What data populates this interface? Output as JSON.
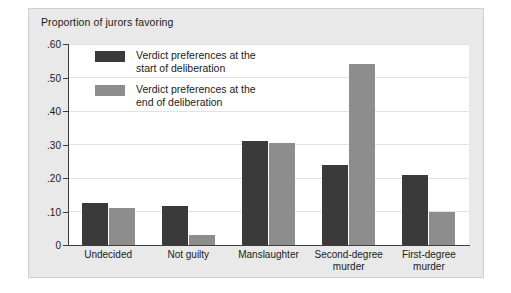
{
  "figure": {
    "title": "Proportion of jurors favoring"
  },
  "legend": {
    "items": [
      {
        "key": "start",
        "label": "Verdict preferences at the\nstart of deliberation",
        "color": "#3a3a3a"
      },
      {
        "key": "end",
        "label": "Verdict preferences at the\nend of deliberation",
        "color": "#8d8d8d"
      }
    ]
  },
  "axis": {
    "y_ticks": [
      "0",
      ".10",
      ".20",
      ".30",
      ".40",
      ".50",
      ".60"
    ]
  },
  "chart_data": {
    "type": "bar",
    "title": "Proportion of jurors favoring",
    "xlabel": "",
    "ylabel": "",
    "ylim": [
      0,
      0.6
    ],
    "ytick_values": [
      0,
      0.1,
      0.2,
      0.3,
      0.4,
      0.5,
      0.6
    ],
    "ytick_labels": [
      "0",
      ".10",
      ".20",
      ".30",
      ".40",
      ".50",
      ".60"
    ],
    "grid": true,
    "legend_position": "upper-left-inside",
    "categories": [
      "Undecided",
      "Not guilty",
      "Manslaughter",
      "Second-degree murder",
      "First-degree murder"
    ],
    "category_lines": [
      [
        "Undecided"
      ],
      [
        "Not guilty"
      ],
      [
        "Manslaughter"
      ],
      [
        "Second-degree",
        "murder"
      ],
      [
        "First-degree",
        "murder"
      ]
    ],
    "series": [
      {
        "name": "Verdict preferences at the start of deliberation",
        "color": "#3a3a3a",
        "values": [
          0.125,
          0.115,
          0.31,
          0.24,
          0.21
        ]
      },
      {
        "name": "Verdict preferences at the end of deliberation",
        "color": "#8d8d8d",
        "values": [
          0.11,
          0.03,
          0.305,
          0.54,
          0.1
        ]
      }
    ]
  }
}
